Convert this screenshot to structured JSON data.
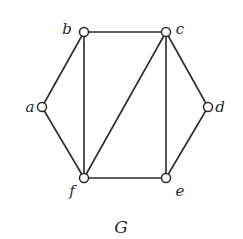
{
  "graph": {
    "title": "G",
    "nodes": [
      {
        "id": "a",
        "label": "a",
        "x": 42,
        "y": 107,
        "lx": 30,
        "ly": 112
      },
      {
        "id": "b",
        "label": "b",
        "x": 84,
        "y": 32,
        "lx": 67,
        "ly": 34
      },
      {
        "id": "c",
        "label": "c",
        "x": 166,
        "y": 32,
        "lx": 180,
        "ly": 34
      },
      {
        "id": "d",
        "label": "d",
        "x": 208,
        "y": 107,
        "lx": 220,
        "ly": 112
      },
      {
        "id": "e",
        "label": "e",
        "x": 166,
        "y": 178,
        "lx": 180,
        "ly": 196
      },
      {
        "id": "f",
        "label": "f",
        "x": 84,
        "y": 178,
        "lx": 72,
        "ly": 196
      }
    ],
    "edges": [
      [
        "a",
        "b"
      ],
      [
        "a",
        "f"
      ],
      [
        "b",
        "c"
      ],
      [
        "b",
        "f"
      ],
      [
        "c",
        "f"
      ],
      [
        "c",
        "e"
      ],
      [
        "c",
        "d"
      ],
      [
        "d",
        "e"
      ],
      [
        "e",
        "f"
      ]
    ]
  }
}
